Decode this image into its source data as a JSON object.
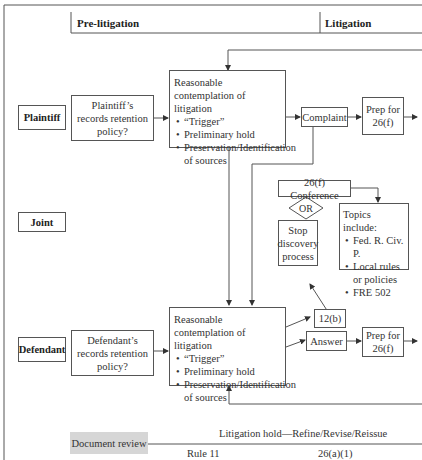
{
  "phases": {
    "pre_litigation": "Pre-litigation",
    "litigation": "Litigation"
  },
  "lanes": {
    "plaintiff": "Plaintiff",
    "joint": "Joint",
    "defendant": "Defendant"
  },
  "plaintiff": {
    "retention": "Plaintiff’s records retention policy?",
    "contemplation_title": "Reasonable contemplation of litigation",
    "contemplation_bullets": [
      "“Trigger”",
      "Preliminary hold",
      "Preservation/Identification of sources"
    ],
    "complaint": "Complaint",
    "prep": "Prep for 26(f)"
  },
  "joint": {
    "conference": "26(f) Conference",
    "or": "OR",
    "stop": "Stop discovery process",
    "topics_title": "Topics include:",
    "topics": [
      "Fed. R. Civ. P.",
      "Local rules or policies",
      "FRE 502"
    ],
    "rule12b": "12(b)"
  },
  "defendant": {
    "retention": "Defendant’s records retention policy?",
    "contemplation_title": "Reasonable contemplation of litigation",
    "contemplation_bullets": [
      "“Trigger”",
      "Preliminary hold",
      "Preservation/Identification of sources"
    ],
    "answer": "Answer",
    "prep": "Prep for 26(f)"
  },
  "bottom": {
    "document_review": "Document review",
    "hold": "Litigation hold—Refine/Revise/Reissue",
    "rule11": "Rule 11",
    "rule26a1": "26(a)(1)"
  },
  "colors": {
    "line": "#555555",
    "gray_box": "#d6d6d6"
  }
}
